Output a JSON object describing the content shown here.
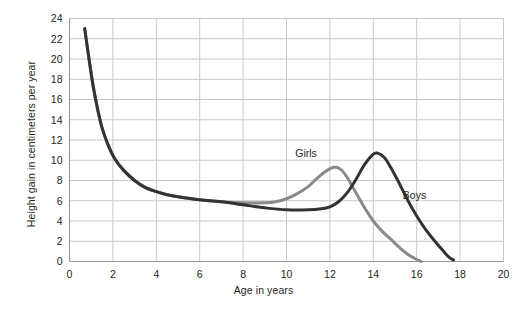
{
  "chart_data": {
    "type": "line",
    "title": "",
    "xlabel": "Age in years",
    "ylabel": "Height gain in centimeters per year",
    "xlim": [
      0,
      20
    ],
    "ylim": [
      0,
      24
    ],
    "xticks": [
      0,
      2,
      4,
      6,
      8,
      10,
      12,
      14,
      16,
      18,
      20
    ],
    "yticks": [
      0,
      2,
      4,
      6,
      8,
      10,
      12,
      14,
      16,
      18,
      20,
      22,
      24
    ],
    "grid": true,
    "legend": "inline-annotations",
    "colors": {
      "girls": "#8a8a8a",
      "boys": "#333333",
      "grid": "#c8c8c8",
      "axis": "#9a9a9a",
      "text": "#231f20"
    },
    "annotations": [
      {
        "text": "Girls",
        "x": 10.9,
        "y": 10.3
      },
      {
        "text": "Boys",
        "x": 15.9,
        "y": 6.2
      }
    ],
    "series": [
      {
        "name": "Girls",
        "color": "#8a8a8a",
        "peak_age": 12.2,
        "peak_value": 9.3,
        "end_age": 16.2,
        "points": [
          [
            0.7,
            23.0
          ],
          [
            0.9,
            20.0
          ],
          [
            1.1,
            17.2
          ],
          [
            1.3,
            15.0
          ],
          [
            1.5,
            13.2
          ],
          [
            1.8,
            11.4
          ],
          [
            2.1,
            10.1
          ],
          [
            2.5,
            9.0
          ],
          [
            3.0,
            8.0
          ],
          [
            3.5,
            7.3
          ],
          [
            4.0,
            6.9
          ],
          [
            4.5,
            6.6
          ],
          [
            5.0,
            6.4
          ],
          [
            6.0,
            6.1
          ],
          [
            7.0,
            5.9
          ],
          [
            8.0,
            5.8
          ],
          [
            9.0,
            5.8
          ],
          [
            9.5,
            5.9
          ],
          [
            10.0,
            6.2
          ],
          [
            10.5,
            6.7
          ],
          [
            11.0,
            7.4
          ],
          [
            11.4,
            8.2
          ],
          [
            11.8,
            8.9
          ],
          [
            12.2,
            9.3
          ],
          [
            12.5,
            9.1
          ],
          [
            12.8,
            8.3
          ],
          [
            13.2,
            6.8
          ],
          [
            13.6,
            5.3
          ],
          [
            14.0,
            4.0
          ],
          [
            14.4,
            3.0
          ],
          [
            14.8,
            2.2
          ],
          [
            15.2,
            1.4
          ],
          [
            15.6,
            0.7
          ],
          [
            16.0,
            0.2
          ],
          [
            16.2,
            0.0
          ]
        ]
      },
      {
        "name": "Boys",
        "color": "#333333",
        "peak_age": 14.1,
        "peak_value": 10.7,
        "end_age": 17.7,
        "points": [
          [
            0.7,
            23.0
          ],
          [
            0.9,
            20.0
          ],
          [
            1.1,
            17.2
          ],
          [
            1.3,
            15.0
          ],
          [
            1.5,
            13.2
          ],
          [
            1.8,
            11.4
          ],
          [
            2.1,
            10.1
          ],
          [
            2.5,
            9.0
          ],
          [
            3.0,
            8.0
          ],
          [
            3.5,
            7.3
          ],
          [
            4.0,
            6.9
          ],
          [
            4.5,
            6.6
          ],
          [
            5.0,
            6.4
          ],
          [
            6.0,
            6.1
          ],
          [
            7.0,
            5.9
          ],
          [
            8.0,
            5.6
          ],
          [
            9.0,
            5.3
          ],
          [
            10.0,
            5.1
          ],
          [
            11.0,
            5.1
          ],
          [
            11.6,
            5.2
          ],
          [
            12.0,
            5.4
          ],
          [
            12.4,
            5.9
          ],
          [
            12.8,
            6.8
          ],
          [
            13.2,
            8.1
          ],
          [
            13.6,
            9.6
          ],
          [
            14.0,
            10.6
          ],
          [
            14.2,
            10.7
          ],
          [
            14.5,
            10.3
          ],
          [
            14.8,
            9.3
          ],
          [
            15.2,
            7.7
          ],
          [
            15.6,
            6.0
          ],
          [
            16.0,
            4.5
          ],
          [
            16.4,
            3.2
          ],
          [
            16.8,
            2.1
          ],
          [
            17.2,
            1.1
          ],
          [
            17.5,
            0.4
          ],
          [
            17.7,
            0.15
          ]
        ]
      }
    ]
  }
}
